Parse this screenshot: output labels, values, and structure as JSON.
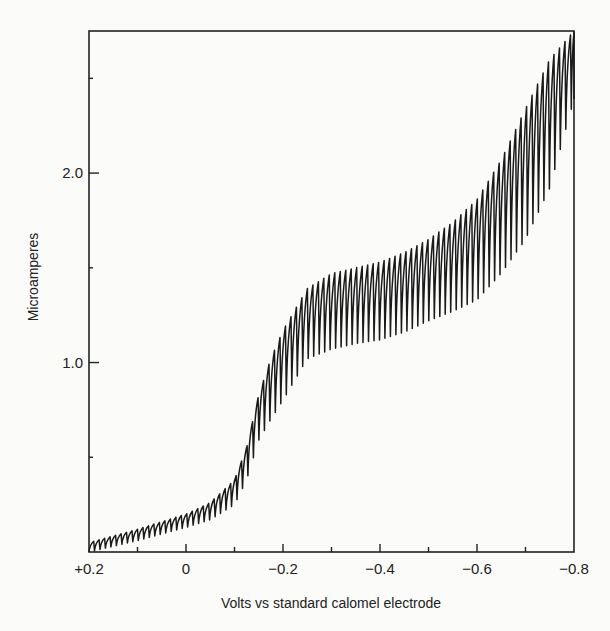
{
  "chart_data": {
    "type": "line",
    "title": "",
    "xlabel": "Volts vs standard calomel electrode",
    "ylabel": "Microamperes",
    "xlim": [
      0.2,
      -0.8
    ],
    "ylim": [
      0,
      2.75
    ],
    "grid": false,
    "legend": null,
    "x_ticks": [
      {
        "value": 0.2,
        "label": "+0.2",
        "major": true
      },
      {
        "value": 0.1,
        "label": "",
        "major": false
      },
      {
        "value": 0.0,
        "label": "0",
        "major": true
      },
      {
        "value": -0.1,
        "label": "",
        "major": false
      },
      {
        "value": -0.2,
        "label": "−0.2",
        "major": true
      },
      {
        "value": -0.3,
        "label": "",
        "major": false
      },
      {
        "value": -0.4,
        "label": "−0.4",
        "major": true
      },
      {
        "value": -0.5,
        "label": "",
        "major": false
      },
      {
        "value": -0.6,
        "label": "−0.6",
        "major": true
      },
      {
        "value": -0.7,
        "label": "",
        "major": false
      },
      {
        "value": -0.8,
        "label": "−0.8",
        "major": true
      }
    ],
    "y_ticks": [
      {
        "value": 0.5,
        "label": "",
        "major": false
      },
      {
        "value": 1.0,
        "label": "1.0",
        "major": true
      },
      {
        "value": 1.5,
        "label": "",
        "major": false
      },
      {
        "value": 2.0,
        "label": "2.0",
        "major": true
      },
      {
        "value": 2.5,
        "label": "",
        "major": false
      }
    ],
    "oscillation_period_volts": 0.0113,
    "series": [
      {
        "name": "upper envelope (max current per drop)",
        "x": [
          0.2,
          0.1,
          0.0,
          -0.05,
          -0.1,
          -0.125,
          -0.15,
          -0.175,
          -0.2,
          -0.25,
          -0.3,
          -0.35,
          -0.4,
          -0.45,
          -0.5,
          -0.55,
          -0.6,
          -0.65,
          -0.7,
          -0.75,
          -0.8
        ],
        "values": [
          0.05,
          0.12,
          0.2,
          0.26,
          0.38,
          0.55,
          0.83,
          1.02,
          1.17,
          1.39,
          1.47,
          1.5,
          1.53,
          1.58,
          1.65,
          1.74,
          1.86,
          2.07,
          2.34,
          2.6,
          2.75
        ]
      },
      {
        "name": "lower envelope (min current per drop)",
        "x": [
          0.2,
          0.1,
          0.0,
          -0.05,
          -0.1,
          -0.125,
          -0.15,
          -0.175,
          -0.2,
          -0.25,
          -0.3,
          -0.35,
          -0.4,
          -0.45,
          -0.5,
          -0.55,
          -0.6,
          -0.65,
          -0.7,
          -0.75,
          -0.8
        ],
        "values": [
          0.0,
          0.06,
          0.13,
          0.17,
          0.25,
          0.38,
          0.59,
          0.7,
          0.8,
          1.02,
          1.07,
          1.1,
          1.12,
          1.16,
          1.22,
          1.27,
          1.33,
          1.47,
          1.65,
          1.92,
          2.39
        ]
      }
    ]
  },
  "layout": {
    "plot_left_px": 89,
    "plot_right_px": 574,
    "plot_top_px": 31,
    "plot_bottom_px": 552,
    "line_color": "#1a1a1a",
    "axis_color": "#222222"
  }
}
